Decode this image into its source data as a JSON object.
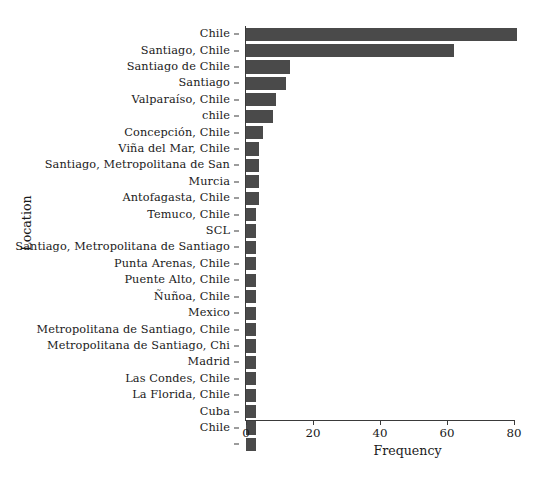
{
  "chart_data": {
    "type": "bar",
    "orientation": "horizontal",
    "title": "",
    "xlabel": "Frequency",
    "ylabel": "Location",
    "xlim": [
      0,
      85
    ],
    "ylim": [
      0,
      24
    ],
    "grid": false,
    "legend": null,
    "bar_color": "#4a4a4a",
    "axis_color": "#3a3a3a",
    "background": "#ffffff",
    "xticks": [
      0,
      20,
      40,
      60,
      80
    ],
    "xtick_labels": [
      "0",
      "20",
      "40",
      "60",
      "80"
    ],
    "categories": [
      "Chile",
      "Santiago, Chile",
      "Santiago de Chile",
      "Santiago",
      "Valparaíso, Chile",
      "chile",
      "Concepción, Chile",
      "Viña del Mar, Chile",
      "Santiago, Metropolitana de San",
      "Murcia",
      "Antofagasta, Chile",
      "Temuco, Chile",
      "SCL",
      "Santiago, Metropolitana de Santiago",
      "Punta Arenas, Chile",
      "Puente Alto, Chile",
      "Ñuñoa, Chile",
      "Mexico",
      "Metropolitana de Santiago, Chile",
      "Metropolitana de Santiago, Chi",
      "Madrid",
      "Las Condes, Chile",
      "La Florida, Chile",
      "Cuba",
      "Chile ",
      ""
    ],
    "values": [
      81,
      62,
      13,
      12,
      9,
      8,
      5,
      4,
      4,
      4,
      4,
      3,
      3,
      3,
      3,
      3,
      3,
      3,
      3,
      3,
      3,
      3,
      3,
      3,
      3,
      3
    ]
  }
}
